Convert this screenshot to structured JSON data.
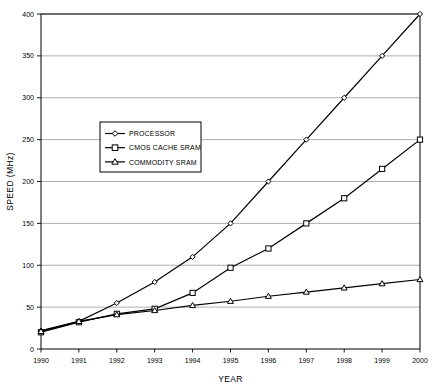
{
  "chart_data": {
    "type": "line",
    "title": "",
    "xlabel": "YEAR",
    "ylabel": "SPEED (MHz)",
    "x": [
      1990,
      1991,
      1992,
      1993,
      1994,
      1995,
      1996,
      1997,
      1998,
      1999,
      2000
    ],
    "xticklabels": [
      "1990",
      "1991",
      "1992",
      "1993",
      "1994",
      "1995",
      "1996",
      "1997",
      "1998",
      "1999",
      "2000"
    ],
    "yticks": [
      0,
      50,
      100,
      150,
      200,
      250,
      300,
      350,
      400
    ],
    "yticklabels": [
      "0",
      "50",
      "100",
      "150",
      "200",
      "250",
      "300",
      "350",
      "400"
    ],
    "ylim": [
      0,
      400
    ],
    "xlim": [
      1990,
      2000
    ],
    "grid": "horizontal",
    "legend_position": "center-left",
    "series": [
      {
        "name": "PROCESSOR",
        "marker": "diamond",
        "values": [
          22,
          33,
          55,
          80,
          110,
          150,
          200,
          250,
          300,
          350,
          400
        ]
      },
      {
        "name": "CMOS CACHE SRAM",
        "marker": "square",
        "values": [
          20,
          32,
          42,
          48,
          67,
          97,
          120,
          150,
          180,
          215,
          250
        ]
      },
      {
        "name": "COMMODITY SRAM",
        "marker": "triangle",
        "values": [
          21,
          33,
          41,
          46,
          52,
          57,
          63,
          68,
          73,
          78,
          83
        ]
      }
    ],
    "colors": {
      "line": "#000000",
      "grid": "#9a9a9a",
      "axis": "#000000",
      "background": "#ffffff"
    }
  }
}
